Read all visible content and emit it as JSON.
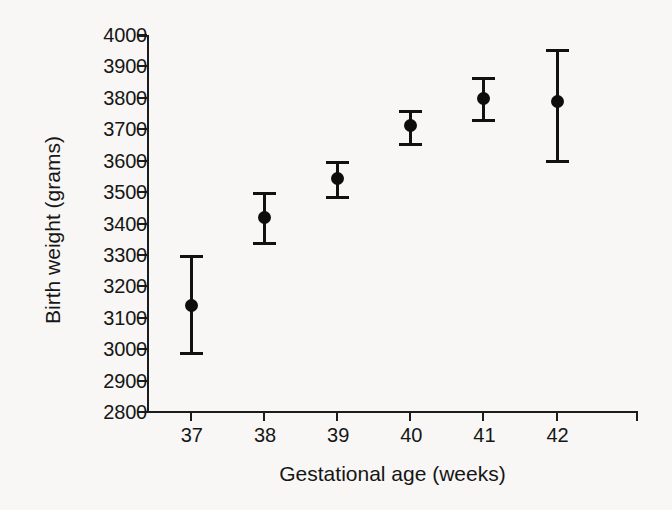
{
  "chart_data": {
    "type": "scatter",
    "title": "",
    "xlabel": "Gestational age (weeks)",
    "ylabel": "Birth weight (grams)",
    "categories": [
      "37",
      "38",
      "39",
      "40",
      "41",
      "42"
    ],
    "x": [
      37,
      38,
      39,
      40,
      41,
      42
    ],
    "values": [
      3140,
      3420,
      3545,
      3715,
      3800,
      3790
    ],
    "error_low": [
      2985,
      3335,
      3480,
      3650,
      3725,
      3595
    ],
    "error_high": [
      3300,
      3500,
      3600,
      3760,
      3865,
      3955
    ],
    "series": [
      {
        "name": "Mean birth weight",
        "values": [
          3140,
          3420,
          3545,
          3715,
          3800,
          3790
        ]
      }
    ],
    "points": [
      {
        "x": "37",
        "mean": 3140,
        "low": 2985,
        "high": 3300
      },
      {
        "x": "38",
        "mean": 3420,
        "low": 3335,
        "high": 3500
      },
      {
        "x": "39",
        "mean": 3545,
        "low": 3480,
        "high": 3600
      },
      {
        "x": "40",
        "mean": 3715,
        "low": 3650,
        "high": 3760
      },
      {
        "x": "41",
        "mean": 3800,
        "low": 3725,
        "high": 3865
      },
      {
        "x": "42",
        "mean": 3790,
        "low": 3595,
        "high": 3955
      }
    ],
    "ylim": [
      2800,
      4000
    ],
    "ytick_labels": [
      "4000",
      "3900",
      "3800",
      "3700",
      "3600",
      "3500",
      "3400",
      "3300",
      "3200",
      "3100",
      "3000",
      "2900",
      "2800"
    ],
    "ytick_values": [
      4000,
      3900,
      3800,
      3700,
      3600,
      3500,
      3400,
      3300,
      3200,
      3100,
      3000,
      2900,
      2800
    ],
    "xlim": [
      36.4,
      43.1
    ],
    "grid": false,
    "legend": null,
    "marker_color": "#0d0d0d",
    "axis_color": "#1c1c1c",
    "background_color": "#f8f7f5"
  }
}
